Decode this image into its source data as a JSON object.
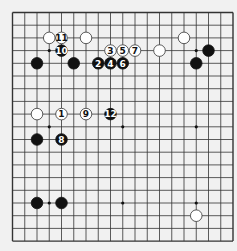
{
  "board": {
    "size": 19,
    "background": "#f1f1f1",
    "line_color": "#333333",
    "star_points": [
      [
        4,
        4
      ],
      [
        10,
        4
      ],
      [
        16,
        4
      ],
      [
        4,
        10
      ],
      [
        10,
        10
      ],
      [
        16,
        10
      ],
      [
        4,
        16
      ],
      [
        10,
        16
      ],
      [
        16,
        16
      ]
    ],
    "stones": [
      {
        "color": "white",
        "col": 4,
        "row": 3,
        "label": ""
      },
      {
        "color": "white",
        "col": 5,
        "row": 3,
        "label": "11"
      },
      {
        "color": "white",
        "col": 7,
        "row": 3,
        "label": ""
      },
      {
        "color": "black",
        "col": 5,
        "row": 4,
        "label": "10"
      },
      {
        "color": "black",
        "col": 3,
        "row": 5,
        "label": ""
      },
      {
        "color": "black",
        "col": 6,
        "row": 5,
        "label": ""
      },
      {
        "color": "white",
        "col": 9,
        "row": 4,
        "label": "3"
      },
      {
        "color": "white",
        "col": 10,
        "row": 4,
        "label": "5"
      },
      {
        "color": "white",
        "col": 11,
        "row": 4,
        "label": "7"
      },
      {
        "color": "black",
        "col": 8,
        "row": 5,
        "label": "2"
      },
      {
        "color": "black",
        "col": 9,
        "row": 5,
        "label": "4"
      },
      {
        "color": "black",
        "col": 10,
        "row": 5,
        "label": "6"
      },
      {
        "color": "white",
        "col": 13,
        "row": 4,
        "label": ""
      },
      {
        "color": "white",
        "col": 15,
        "row": 3,
        "label": ""
      },
      {
        "color": "black",
        "col": 17,
        "row": 4,
        "label": ""
      },
      {
        "color": "black",
        "col": 16,
        "row": 5,
        "label": ""
      },
      {
        "color": "white",
        "col": 3,
        "row": 9,
        "label": ""
      },
      {
        "color": "white",
        "col": 5,
        "row": 9,
        "label": "1"
      },
      {
        "color": "white",
        "col": 7,
        "row": 9,
        "label": "9"
      },
      {
        "color": "black",
        "col": 9,
        "row": 9,
        "label": "12"
      },
      {
        "color": "black",
        "col": 3,
        "row": 11,
        "label": ""
      },
      {
        "color": "black",
        "col": 5,
        "row": 11,
        "label": "8"
      },
      {
        "color": "black",
        "col": 3,
        "row": 16,
        "label": ""
      },
      {
        "color": "black",
        "col": 5,
        "row": 16,
        "label": ""
      },
      {
        "color": "white",
        "col": 16,
        "row": 17,
        "label": ""
      }
    ]
  }
}
